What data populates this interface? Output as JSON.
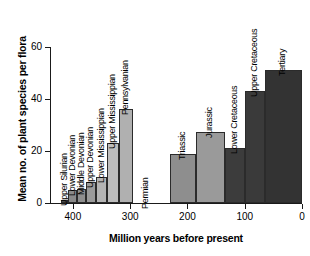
{
  "chart_data": {
    "type": "bar",
    "title": "",
    "xlabel": "Million years before present",
    "ylabel": "Mean no. of plant species per flora",
    "xlim": [
      440,
      0
    ],
    "ylim": [
      0,
      60
    ],
    "x_reversed": true,
    "grid": false,
    "legend": "none",
    "xticks": [
      "400",
      "300",
      "200",
      "100",
      "0"
    ],
    "xtick_values": [
      400,
      300,
      200,
      100,
      0
    ],
    "yticks": [
      "0",
      "20",
      "40",
      "60"
    ],
    "ytick_values": [
      0,
      20,
      40,
      60
    ],
    "categories": [
      "Upper Silurian",
      "Lower Devonian",
      "Middle Devonian",
      "Upper Devonian",
      "Lower Mississippian",
      "Upper Mississippian",
      "Pennsylvanian",
      "Permian",
      "Triassic",
      "Jurassic",
      "Lower Cretaceous",
      "Upper Cretaceous",
      "Tertiary"
    ],
    "values": [
      1,
      5,
      5.5,
      8,
      10,
      23,
      36,
      null,
      19,
      27.5,
      21,
      43,
      51
    ],
    "bars": [
      {
        "label": "Upper Silurian",
        "value": 1,
        "x_start": 420,
        "x_end": 408,
        "color": "#4a4a4a"
      },
      {
        "label": "Lower Devonian",
        "value": 5,
        "x_start": 408,
        "x_end": 393,
        "color": "#8a8a8a"
      },
      {
        "label": "Middle Devonian",
        "value": 5.5,
        "x_start": 393,
        "x_end": 377,
        "color": "#8e8e8e"
      },
      {
        "label": "Upper Devonian",
        "value": 8,
        "x_start": 377,
        "x_end": 360,
        "color": "#9a9a9a"
      },
      {
        "label": "Lower Mississippian",
        "value": 10,
        "x_start": 360,
        "x_end": 340,
        "color": "#b4b4b4"
      },
      {
        "label": "Upper Mississippian",
        "value": 23,
        "x_start": 340,
        "x_end": 320,
        "color": "#bdbdbd"
      },
      {
        "label": "Pennsylvanian",
        "value": 36,
        "x_start": 320,
        "x_end": 295,
        "color": "#b0b0b0"
      },
      {
        "label": "Permian",
        "value": null,
        "x_start": 295,
        "x_end": 250,
        "color": "#ffffff"
      },
      {
        "label": "Triassic",
        "value": 19,
        "x_start": 230,
        "x_end": 185,
        "color": "#8e8e8e"
      },
      {
        "label": "Jurassic",
        "value": 27.5,
        "x_start": 185,
        "x_end": 135,
        "color": "#9a9a9a"
      },
      {
        "label": "Lower Cretaceous",
        "value": 21,
        "x_start": 135,
        "x_end": 100,
        "color": "#3c3c3c"
      },
      {
        "label": "Upper Cretaceous",
        "value": 43,
        "x_start": 100,
        "x_end": 65,
        "color": "#3a3a3a"
      },
      {
        "label": "Tertiary",
        "value": 51,
        "x_start": 65,
        "x_end": 0,
        "color": "#333333"
      }
    ]
  },
  "colors": {
    "axis": "#1a1a1a",
    "background": "#ffffff",
    "bar_border": "#2b2b2b"
  }
}
